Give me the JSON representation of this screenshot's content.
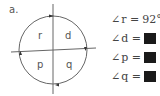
{
  "figure": {
    "label": "a.",
    "quadrants": {
      "top_left": "r",
      "top_right": "d",
      "bottom_left": "p",
      "bottom_right": "q"
    }
  },
  "equations": [
    {
      "angle_symbol": "∠",
      "name": "r",
      "equals": "=",
      "value": "92°",
      "hidden": false
    },
    {
      "angle_symbol": "∠",
      "name": "d",
      "equals": "=",
      "value": "",
      "hidden": true
    },
    {
      "angle_symbol": "∠",
      "name": "p",
      "equals": "=",
      "value": "",
      "hidden": true
    },
    {
      "angle_symbol": "∠",
      "name": "q",
      "equals": "=",
      "value": "",
      "hidden": true
    }
  ]
}
